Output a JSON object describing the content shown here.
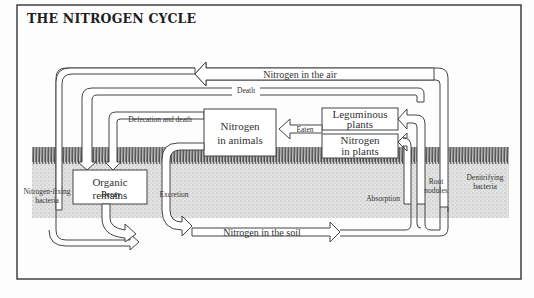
{
  "title": "THE NITROGEN CYCLE",
  "colors": {
    "border": "#333333",
    "line": "#444444",
    "fill": "#ffffff",
    "ground": "#c8c8c8",
    "grass": "#2a2a2a",
    "text": "#333333"
  },
  "boxes": {
    "organic_remains": [
      "Organic",
      "remains"
    ],
    "nitrogen_in_animals": [
      "Nitrogen",
      "in animals"
    ],
    "leguminous_plants": [
      "Leguminous",
      "plants"
    ],
    "nitrogen_in_plants": [
      "Nitrogen",
      "in plants"
    ]
  },
  "arrows": {
    "nitrogen_in_air": "Nitrogen in the air",
    "nitrogen_in_soil": "Nitrogen in the soil"
  },
  "labels": {
    "death": "Death",
    "defecation": "Defecation and death",
    "eaten": "Eaten",
    "nitrogen_fixing": [
      "Nitrogen-fixing",
      "bacteria"
    ],
    "decay": "Decay",
    "excretion": "Excretion",
    "absorption": "Absorption",
    "root_nodules": [
      "Root",
      "nodules"
    ],
    "denitrifying": [
      "Denitrifying",
      "bacteria"
    ]
  }
}
